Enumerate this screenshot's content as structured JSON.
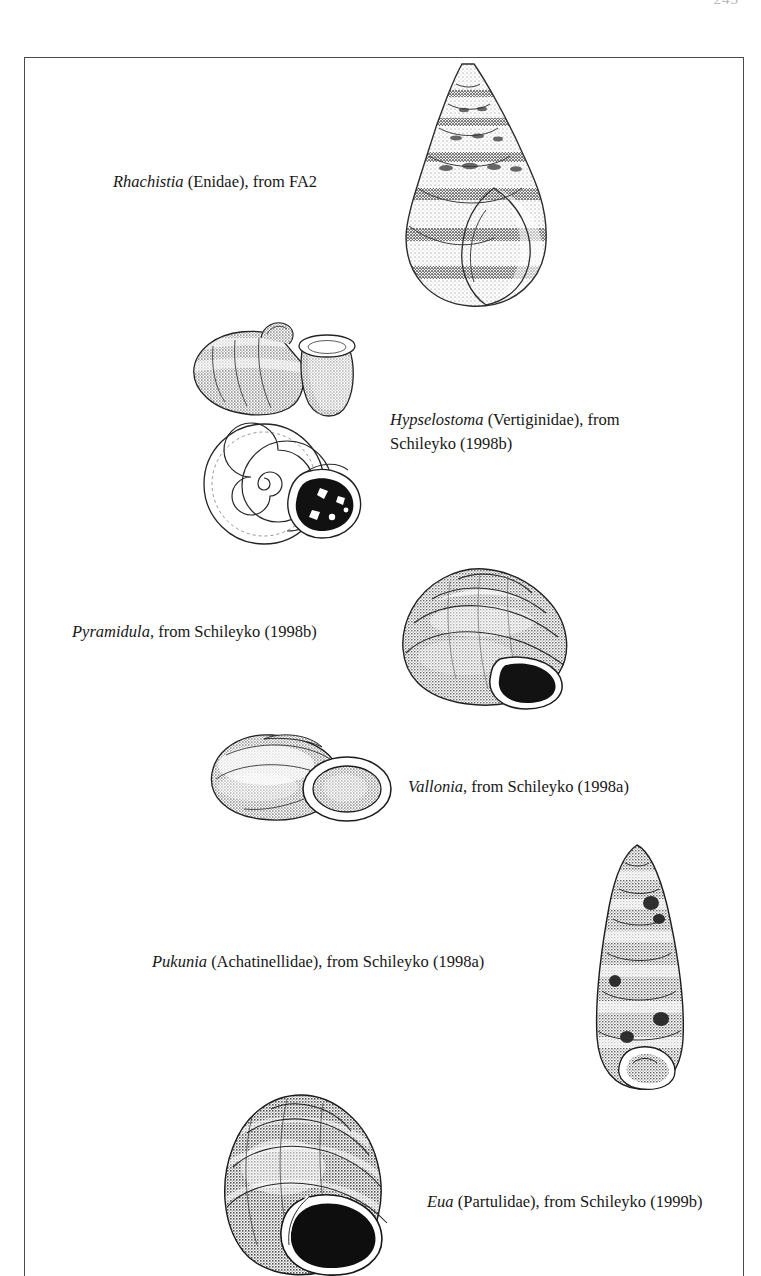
{
  "page": {
    "folio": "243",
    "background_color": "#ffffff",
    "ink_color": "#171717",
    "frame_color": "#4a4a4a"
  },
  "plate": {
    "figures": [
      {
        "id": "rhachistia",
        "genus": "Rhachistia",
        "rest": " (Enidae), from FA2",
        "family": "Enidae",
        "source": "FA2",
        "shell_form": "ovate-conic, banded spiral sculpture",
        "views": 1
      },
      {
        "id": "hypselostoma",
        "genus": "Hypselostoma",
        "rest": " (Vertiginidae), from",
        "line2": "Schileyko (1998b)",
        "family": "Vertiginidae",
        "source": "Schileyko (1998b)",
        "shell_form": "depressed with detached flaring aperture; apertural (spiral) view with dark toothed aperture",
        "views": 2
      },
      {
        "id": "pyramidula",
        "genus": "Pyramidula",
        "rest": ", from Schileyko (1998b)",
        "family": "",
        "source": "Schileyko (1998b)",
        "shell_form": "globose-conic, dark rounded aperture",
        "views": 1
      },
      {
        "id": "vallonia",
        "genus": "Vallonia",
        "rest": ", from Schileyko (1998a)",
        "family": "",
        "source": "Schileyko (1998a)",
        "shell_form": "depressed-heliciform with strongly reflected lip",
        "views": 1
      },
      {
        "id": "pukunia",
        "genus": "Pukunia",
        "rest": " (Achatinellidae), from Schileyko (1998a)",
        "family": "Achatinellidae",
        "source": "Schileyko (1998a)",
        "shell_form": "elongate fusiform, many whorls",
        "views": 1
      },
      {
        "id": "eua",
        "genus": "Eua",
        "rest": " (Partulidae), from Schileyko (1999b)",
        "family": "Partulidae",
        "source": "Schileyko (1999b)",
        "shell_form": "ovate-conic, large dark aperture",
        "views": 1
      }
    ]
  }
}
